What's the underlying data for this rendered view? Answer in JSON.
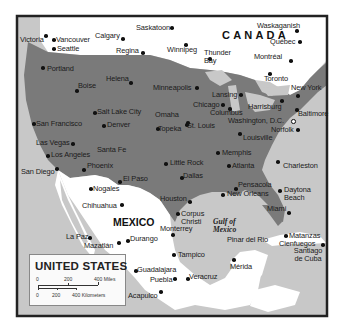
{
  "map": {
    "legend": {
      "title": "UNITED STATES",
      "scale_miles": {
        "labels": [
          "0",
          "200",
          "400 Miles"
        ]
      },
      "scale_km": {
        "labels": [
          "0",
          "200",
          "400 Kilometers"
        ]
      }
    },
    "countries": {
      "canada": "CANADA",
      "mexico": "MEXICO"
    },
    "water_bodies": {
      "gulf_of_mexico": "Gulf of Mexico"
    },
    "colors": {
      "us_land": "#7a7a7a",
      "foreign_land": "#ffffff",
      "water": "#c8c8c8",
      "lakes": "#c8c8c8",
      "frame": "#222222"
    },
    "cities": {
      "victoria": "Victoria",
      "vancouver": "Vancouver",
      "seattle": "Seattle",
      "calgary": "Calgary",
      "saskatoon": "Saskatoon",
      "regina": "Regina",
      "winnipeg": "Winnipeg",
      "thunder_bay": "Thunder Bay",
      "waskaganish": "Waskaganish",
      "quebec": "Québec",
      "montreal": "Montréal",
      "toronto": "Toronto",
      "portland": "Portland",
      "helena": "Helena",
      "minneapolis": "Minneapolis",
      "boise": "Boise",
      "lansing": "Lansing",
      "chicago": "Chicago",
      "harrisburg": "Harrisburg",
      "new_york": "New York",
      "salt_lake_city": "Salt Lake City",
      "omaha": "Omaha",
      "columbus": "Columbus",
      "baltimore": "Baltimore",
      "san_francisco": "San Francisco",
      "denver": "Denver",
      "topeka": "Topeka",
      "st_louis": "St. Louis",
      "washington_dc": "Washington, D.C.",
      "norfolk": "Norfolk",
      "louisville": "Louisville",
      "las_vegas": "Las Vegas",
      "los_angeles": "Los Angeles",
      "santa_fe": "Santa Fe",
      "memphis": "Memphis",
      "little_rock": "Little Rock",
      "atlanta": "Atlanta",
      "charleston": "Charleston",
      "san_diego": "San Diego",
      "phoenix": "Phoenix",
      "dallas": "Dallas",
      "el_paso": "El Paso",
      "pensacola": "Pensacola",
      "nogales": "Nogales",
      "new_orleans": "New Orleans",
      "daytona_beach": "Daytona Beach",
      "houston": "Houston",
      "chihuahua": "Chihuahua",
      "miami": "Miami",
      "corpus_christi": "Corpus Christi",
      "monterrey": "Monterrey",
      "pinar_del_rio": "Pinar del Rio",
      "matanzas": "Matanzas",
      "la_paz": "La Paz",
      "durango": "Durango",
      "mazatlan": "Mazatlán",
      "cienfuegos": "Cienfuegos",
      "santiago_de_cuba": "Santiago de Cuba",
      "tampico": "Tampico",
      "merida": "Mérida",
      "guadalajara": "Guadalajara",
      "puebla": "Puebla",
      "veracruz": "Veracruz",
      "acapulco": "Acapulco"
    }
  }
}
